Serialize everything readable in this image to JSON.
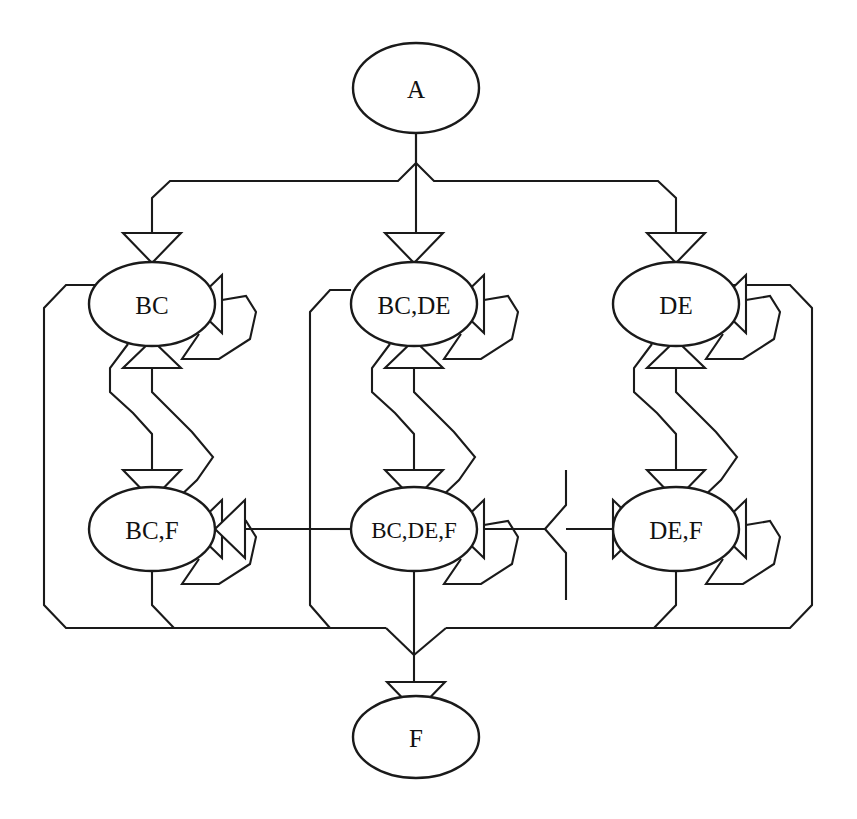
{
  "diagram": {
    "kind": "directed-graph",
    "stroke_color": "#1a1a1a",
    "fill_color": "#ffffff",
    "nodes": [
      {
        "id": "A",
        "label": "A",
        "cx": 416,
        "cy": 88,
        "rx": 63,
        "ry": 45
      },
      {
        "id": "BC",
        "label": "BC",
        "cx": 152,
        "cy": 304,
        "rx": 63,
        "ry": 42
      },
      {
        "id": "BCDE",
        "label": "BC,DE",
        "cx": 414,
        "cy": 304,
        "rx": 63,
        "ry": 42
      },
      {
        "id": "DE",
        "label": "DE",
        "cx": 676,
        "cy": 304,
        "rx": 63,
        "ry": 42
      },
      {
        "id": "BCF",
        "label": "BC,F",
        "cx": 152,
        "cy": 529,
        "rx": 63,
        "ry": 42
      },
      {
        "id": "BCDEF",
        "label": "BC,DE,F",
        "cx": 414,
        "cy": 529,
        "rx": 63,
        "ry": 42
      },
      {
        "id": "DEF",
        "label": "DE,F",
        "cx": 676,
        "cy": 529,
        "rx": 63,
        "ry": 42
      },
      {
        "id": "F",
        "label": "F",
        "cx": 416,
        "cy": 737,
        "rx": 63,
        "ry": 41
      }
    ],
    "edges": [
      {
        "from": "A",
        "to": "BC",
        "type": "fan-out-left"
      },
      {
        "from": "A",
        "to": "BCDE",
        "type": "fan-out-center"
      },
      {
        "from": "A",
        "to": "DE",
        "type": "fan-out-right"
      },
      {
        "from": "BC",
        "to": "BC",
        "type": "self-loop"
      },
      {
        "from": "BCDE",
        "to": "BCDE",
        "type": "self-loop"
      },
      {
        "from": "DE",
        "to": "DE",
        "type": "self-loop"
      },
      {
        "from": "BCF",
        "to": "BCF",
        "type": "self-loop"
      },
      {
        "from": "BCDEF",
        "to": "BCDEF",
        "type": "self-loop"
      },
      {
        "from": "DEF",
        "to": "DEF",
        "type": "self-loop"
      },
      {
        "from": "BC",
        "to": "BCF",
        "type": "bidirectional-vertical"
      },
      {
        "from": "BCDE",
        "to": "BCDEF",
        "type": "bidirectional-vertical"
      },
      {
        "from": "DE",
        "to": "DEF",
        "type": "bidirectional-vertical"
      },
      {
        "from": "BCDEF",
        "to": "BCF",
        "type": "horizontal-left"
      },
      {
        "from": "BCDEF",
        "to": "DEF",
        "type": "horizontal-right"
      },
      {
        "from": "BCF",
        "to": "F",
        "type": "converge-bottom-left"
      },
      {
        "from": "BCDEF",
        "to": "F",
        "type": "converge-bottom-center"
      },
      {
        "from": "DEF",
        "to": "F",
        "type": "converge-bottom-right"
      },
      {
        "from": "BC",
        "to": "F",
        "type": "outer-left-wrap"
      },
      {
        "from": "DE",
        "to": "F",
        "type": "outer-right-wrap"
      },
      {
        "from": "BCDE",
        "to": "F",
        "type": "inner-center-wrap"
      }
    ]
  }
}
